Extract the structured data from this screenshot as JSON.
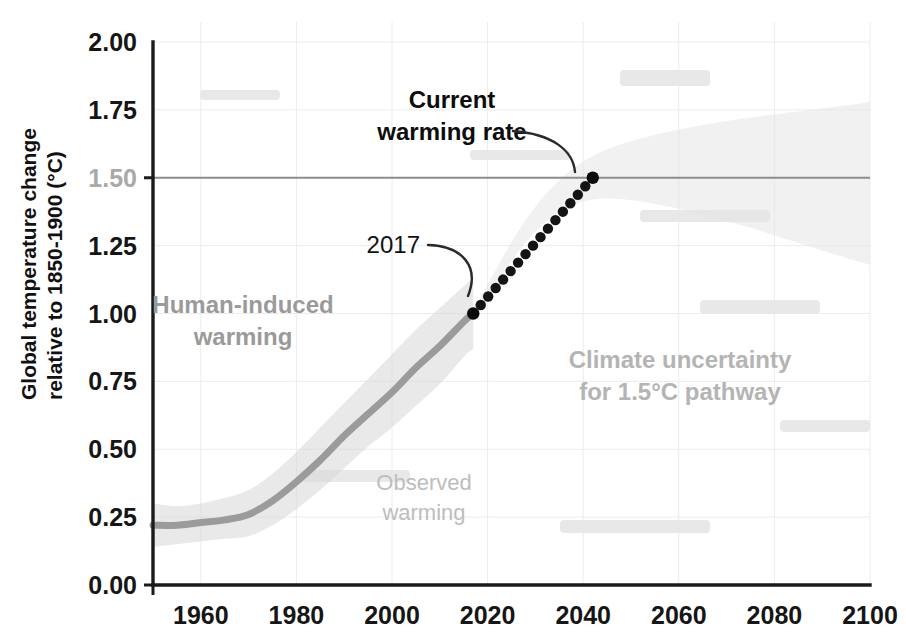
{
  "chart_data": {
    "type": "line",
    "title": "",
    "xlabel": "",
    "ylabel": "Global temperature change relative to 1850-1900 (°C)",
    "ylabel_line1": "Global temperature change",
    "ylabel_line2": "relative to 1850-1900 (°C)",
    "xlim": [
      1950,
      2100
    ],
    "ylim": [
      0.0,
      2.0
    ],
    "grid": true,
    "legend_position": "none",
    "xticks": [
      1960,
      1980,
      2000,
      2020,
      2040,
      2060,
      2080,
      2100
    ],
    "xtick_labels": [
      "1960",
      "1980",
      "2000",
      "2020",
      "2040",
      "2060",
      "2080",
      "2100"
    ],
    "yticks": [
      0.0,
      0.25,
      0.5,
      0.75,
      1.0,
      1.25,
      1.5,
      1.75,
      2.0
    ],
    "ytick_labels": [
      "0.00",
      "0.25",
      "0.50",
      "0.75",
      "1.00",
      "1.25",
      "1.50",
      "1.75",
      "2.00"
    ],
    "reference_line": {
      "name": "1.5degC-threshold",
      "y": 1.5,
      "x_start": 1950,
      "x_end": 2100,
      "color": "#8d8d8d"
    },
    "series": [
      {
        "name": "Human-induced warming",
        "style": "solid-thick",
        "color": "#9b9b9b",
        "x": [
          1950,
          1955,
          1960,
          1965,
          1970,
          1975,
          1980,
          1985,
          1990,
          1995,
          2000,
          2005,
          2010,
          2015,
          2017
        ],
        "values": [
          0.22,
          0.22,
          0.23,
          0.24,
          0.26,
          0.31,
          0.38,
          0.46,
          0.55,
          0.63,
          0.71,
          0.8,
          0.88,
          0.97,
          1.0
        ]
      },
      {
        "name": "Observed warming",
        "style": "uncertainty-band",
        "color": "#d7d7d7",
        "x": [
          1950,
          1955,
          1960,
          1965,
          1970,
          1975,
          1980,
          1985,
          1990,
          1995,
          2000,
          2005,
          2010,
          2015,
          2017
        ],
        "upper": [
          0.3,
          0.29,
          0.3,
          0.32,
          0.35,
          0.41,
          0.49,
          0.58,
          0.67,
          0.76,
          0.85,
          0.94,
          1.02,
          1.1,
          1.13
        ],
        "lower": [
          0.14,
          0.15,
          0.16,
          0.17,
          0.18,
          0.22,
          0.28,
          0.35,
          0.43,
          0.51,
          0.58,
          0.66,
          0.74,
          0.84,
          0.87
        ]
      },
      {
        "name": "Current warming rate projection",
        "style": "dotted",
        "color": "#141414",
        "x": [
          2017,
          2042
        ],
        "values": [
          1.0,
          1.5
        ],
        "dot_count": 17
      },
      {
        "name": "Climate uncertainty for 1.5°C pathway",
        "style": "uncertainty-wedge",
        "color": "#e4e4e4",
        "x": [
          2017,
          2042,
          2100
        ],
        "upper": [
          1.02,
          1.58,
          1.78
        ],
        "lower": [
          0.98,
          1.42,
          1.18
        ]
      }
    ],
    "markers": [
      {
        "name": "point-2017",
        "x": 2017,
        "y": 1.0,
        "color": "#0a0a0a"
      },
      {
        "name": "point-2042",
        "x": 2042,
        "y": 1.5,
        "color": "#0a0a0a"
      }
    ],
    "annotations": [
      {
        "name": "current-warming-rate",
        "text_line1": "Current",
        "text_line2": "warming rate",
        "style": "bold-dark",
        "points_to_x": 2042,
        "points_to_y": 1.5
      },
      {
        "name": "year-2017",
        "text_line1": "2017",
        "text_line2": "",
        "style": "plain-dark",
        "points_to_x": 2017,
        "points_to_y": 1.0
      },
      {
        "name": "human-induced-warming",
        "text_line1": "Human-induced",
        "text_line2": "warming",
        "style": "gray-bold",
        "at_x": 1978,
        "at_y": 1.0
      },
      {
        "name": "observed-warming",
        "text_line1": "Observed",
        "text_line2": "warming",
        "style": "gray-plain",
        "at_x": 2003,
        "at_y": 0.4
      },
      {
        "name": "climate-uncertainty",
        "text_line1": "Climate uncertainty",
        "text_line2": "for 1.5°C pathway",
        "style": "gray-bold-light",
        "at_x": 2068,
        "at_y": 0.72
      }
    ]
  },
  "colors": {
    "axis": "#1b1b1b",
    "human_induced": "#9b9b9b",
    "observed_band": "#d7d7d7",
    "projection_dots": "#141414",
    "reference_line": "#8d8d8d",
    "uncertainty_wedge": "#e4e4e4",
    "gridline": "#ececec",
    "background": "#ffffff"
  }
}
